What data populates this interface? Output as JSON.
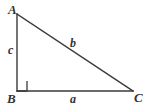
{
  "figure": {
    "type": "right-triangle-diagram",
    "background_color": "#ffffff",
    "stroke_color": "#3a3a3a",
    "label_color": "#333333",
    "vertices": {
      "a": {
        "label": "A",
        "x": 17,
        "y": 14
      },
      "b": {
        "label": "B",
        "x": 17,
        "y": 91
      },
      "c": {
        "label": "C",
        "x": 133,
        "y": 91
      }
    },
    "sides": {
      "leg_vertical": {
        "label": "c",
        "from": "A",
        "to": "B"
      },
      "leg_horizontal": {
        "label": "a",
        "from": "B",
        "to": "C"
      },
      "hypotenuse": {
        "label": "b",
        "from": "A",
        "to": "C"
      }
    },
    "right_angle": {
      "at_vertex": "B",
      "marker": "square",
      "size": 10
    }
  }
}
